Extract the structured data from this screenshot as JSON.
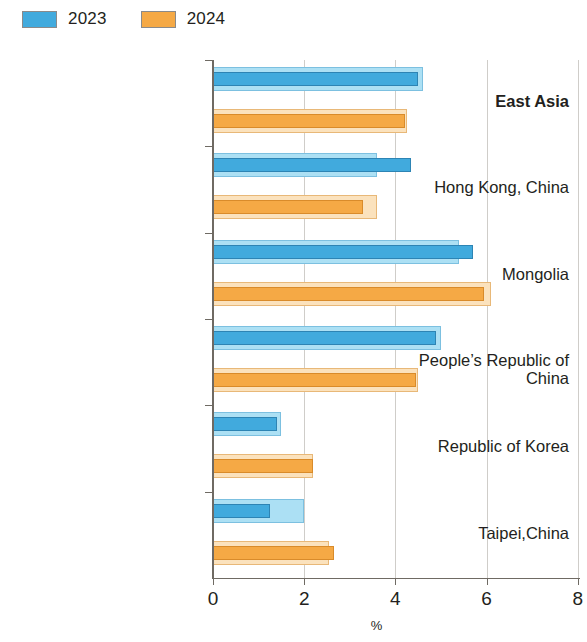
{
  "legend": {
    "entries": [
      {
        "label": "2023",
        "color": "#41aadd",
        "swatch_light": "#ace0f4"
      },
      {
        "label": "2024",
        "color": "#f5a945",
        "swatch_light": "#fbe2bd"
      }
    ]
  },
  "axis": {
    "x_title": "%",
    "x_ticks": [
      "0",
      "2",
      "4",
      "6",
      "8"
    ]
  },
  "categories": [
    {
      "label": "East Asia",
      "bold": true
    },
    {
      "label": "Hong Kong, China",
      "bold": false
    },
    {
      "label": "Mongolia",
      "bold": false
    },
    {
      "label": "People’s Republic of China",
      "bold": false
    },
    {
      "label": "Republic of Korea",
      "bold": false
    },
    {
      "label": "Taipei,China",
      "bold": false
    }
  ],
  "chart_data": {
    "type": "bar",
    "orientation": "horizontal",
    "title": "",
    "xlabel": "%",
    "ylabel": "",
    "xlim": [
      0,
      8
    ],
    "xticks": [
      0,
      2,
      4,
      6,
      8
    ],
    "grid": "vertical",
    "legend_position": "top-left",
    "categories": [
      "East Asia",
      "Hong Kong, China",
      "Mongolia",
      "People’s Republic of China",
      "Republic of Korea",
      "Taipei,China"
    ],
    "series": [
      {
        "name": "2023",
        "color": "#41aadd",
        "values": [
          4.6,
          3.6,
          5.4,
          5.0,
          1.5,
          2.0
        ],
        "inner_values": [
          4.5,
          4.35,
          5.7,
          4.9,
          1.4,
          1.25
        ]
      },
      {
        "name": "2024",
        "color": "#f5a945",
        "values": [
          4.25,
          3.6,
          6.1,
          4.5,
          2.2,
          2.55
        ],
        "inner_values": [
          4.2,
          3.3,
          5.95,
          4.45,
          2.2,
          2.65
        ]
      }
    ]
  },
  "geometry": {
    "x0": 213,
    "px_per_unit": 45.6,
    "plot_top": 60,
    "plot_bottom": 578,
    "group_height": 86.3,
    "bar_outer_h": 24,
    "bar_inner_h": 14
  }
}
